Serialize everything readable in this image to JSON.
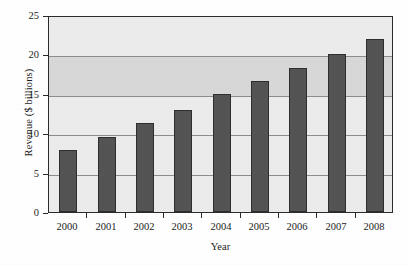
{
  "chart_data": {
    "type": "bar",
    "title": "",
    "xlabel": "Year",
    "ylabel": "Revenue ($ billions)",
    "categories": [
      "2000",
      "2001",
      "2002",
      "2003",
      "2004",
      "2005",
      "2006",
      "2007",
      "2008"
    ],
    "values": [
      7.9,
      9.5,
      11.3,
      13.0,
      15.0,
      16.6,
      18.3,
      20.1,
      22.0
    ],
    "ylim": [
      0,
      25
    ],
    "yticks": [
      0,
      5,
      10,
      15,
      20,
      25
    ],
    "ytick_labels": [
      "0",
      "5",
      "10",
      "15",
      "20",
      "25"
    ],
    "grid": true,
    "legend": false,
    "series_name": "Revenue",
    "colors": {
      "bar_fill": "#545454",
      "bar_edge": "#2e2e2e",
      "plot_background": "#ececec",
      "band_background": "#d8d8d8",
      "gridline": "#8d8d8d",
      "axis": "#2b2b2b",
      "text": "#1c1c1c"
    },
    "shaded_band": {
      "from": 15,
      "to": 20
    }
  }
}
